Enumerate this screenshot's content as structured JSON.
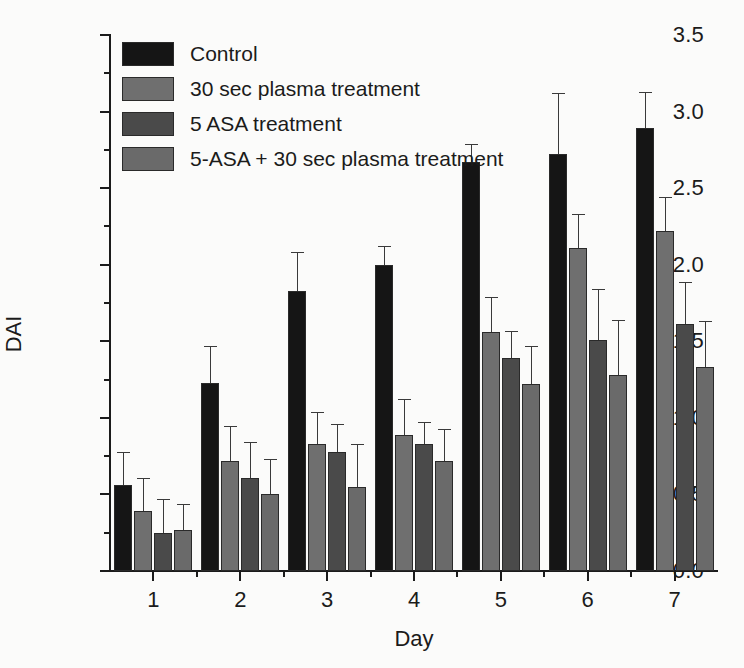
{
  "chart_data": {
    "type": "bar",
    "title": "",
    "subtitle": "",
    "xlabel": "Day",
    "ylabel": "DAI",
    "categories": [
      "1",
      "2",
      "3",
      "4",
      "5",
      "6",
      "7"
    ],
    "xlim": [
      0.5,
      7.5
    ],
    "ylim": [
      0.0,
      3.5
    ],
    "ytick_labels": [
      "0.0",
      "0.5",
      "1.0",
      "1.5",
      "2.0",
      "2.5",
      "3.0",
      "3.5"
    ],
    "ytick_values": [
      0.0,
      0.5,
      1.0,
      1.5,
      2.0,
      2.5,
      3.0,
      3.5
    ],
    "yminor_values": [
      0.25,
      0.75,
      1.25,
      1.75,
      2.25,
      2.75,
      3.25
    ],
    "xtick_values": [
      1,
      2,
      3,
      4,
      5,
      6,
      7
    ],
    "xminor_values": [
      1.5,
      2.5,
      3.5,
      4.5,
      5.5,
      6.5
    ],
    "grid": false,
    "legend_position": "upper-left-inside",
    "error_bars": "std-dev-upper",
    "series": [
      {
        "name": "Control",
        "color": "#151515",
        "values": [
          0.56,
          1.23,
          1.83,
          2.0,
          2.67,
          2.72,
          2.89
        ],
        "errors": [
          0.22,
          0.24,
          0.25,
          0.12,
          0.12,
          0.4,
          0.24
        ]
      },
      {
        "name": "30 sec plasma treatment",
        "color": "#6f6f6f",
        "values": [
          0.39,
          0.72,
          0.83,
          0.89,
          1.56,
          2.11,
          2.22
        ],
        "errors": [
          0.22,
          0.23,
          0.21,
          0.23,
          0.23,
          0.22,
          0.22
        ]
      },
      {
        "name": "5 ASA treatment",
        "color": "#4a4a4a",
        "values": [
          0.25,
          0.61,
          0.78,
          0.83,
          1.39,
          1.51,
          1.61
        ],
        "errors": [
          0.22,
          0.23,
          0.18,
          0.14,
          0.18,
          0.33,
          0.28
        ]
      },
      {
        "name": "5-ASA + 30 sec plasma treatment",
        "color": "#6a6a6a",
        "values": [
          0.27,
          0.5,
          0.55,
          0.72,
          1.22,
          1.28,
          1.33
        ],
        "errors": [
          0.17,
          0.23,
          0.28,
          0.21,
          0.25,
          0.36,
          0.3
        ]
      }
    ]
  },
  "legend": {
    "items": [
      {
        "label": "Control",
        "color": "#151515"
      },
      {
        "label": "30 sec plasma treatment",
        "color": "#6f6f6f"
      },
      {
        "label": "5 ASA treatment",
        "color": "#4a4a4a"
      },
      {
        "label": "5-ASA + 30 sec plasma treatment",
        "color": "#6a6a6a"
      }
    ]
  },
  "axes": {
    "y_title": "DAI",
    "x_title": "Day"
  }
}
